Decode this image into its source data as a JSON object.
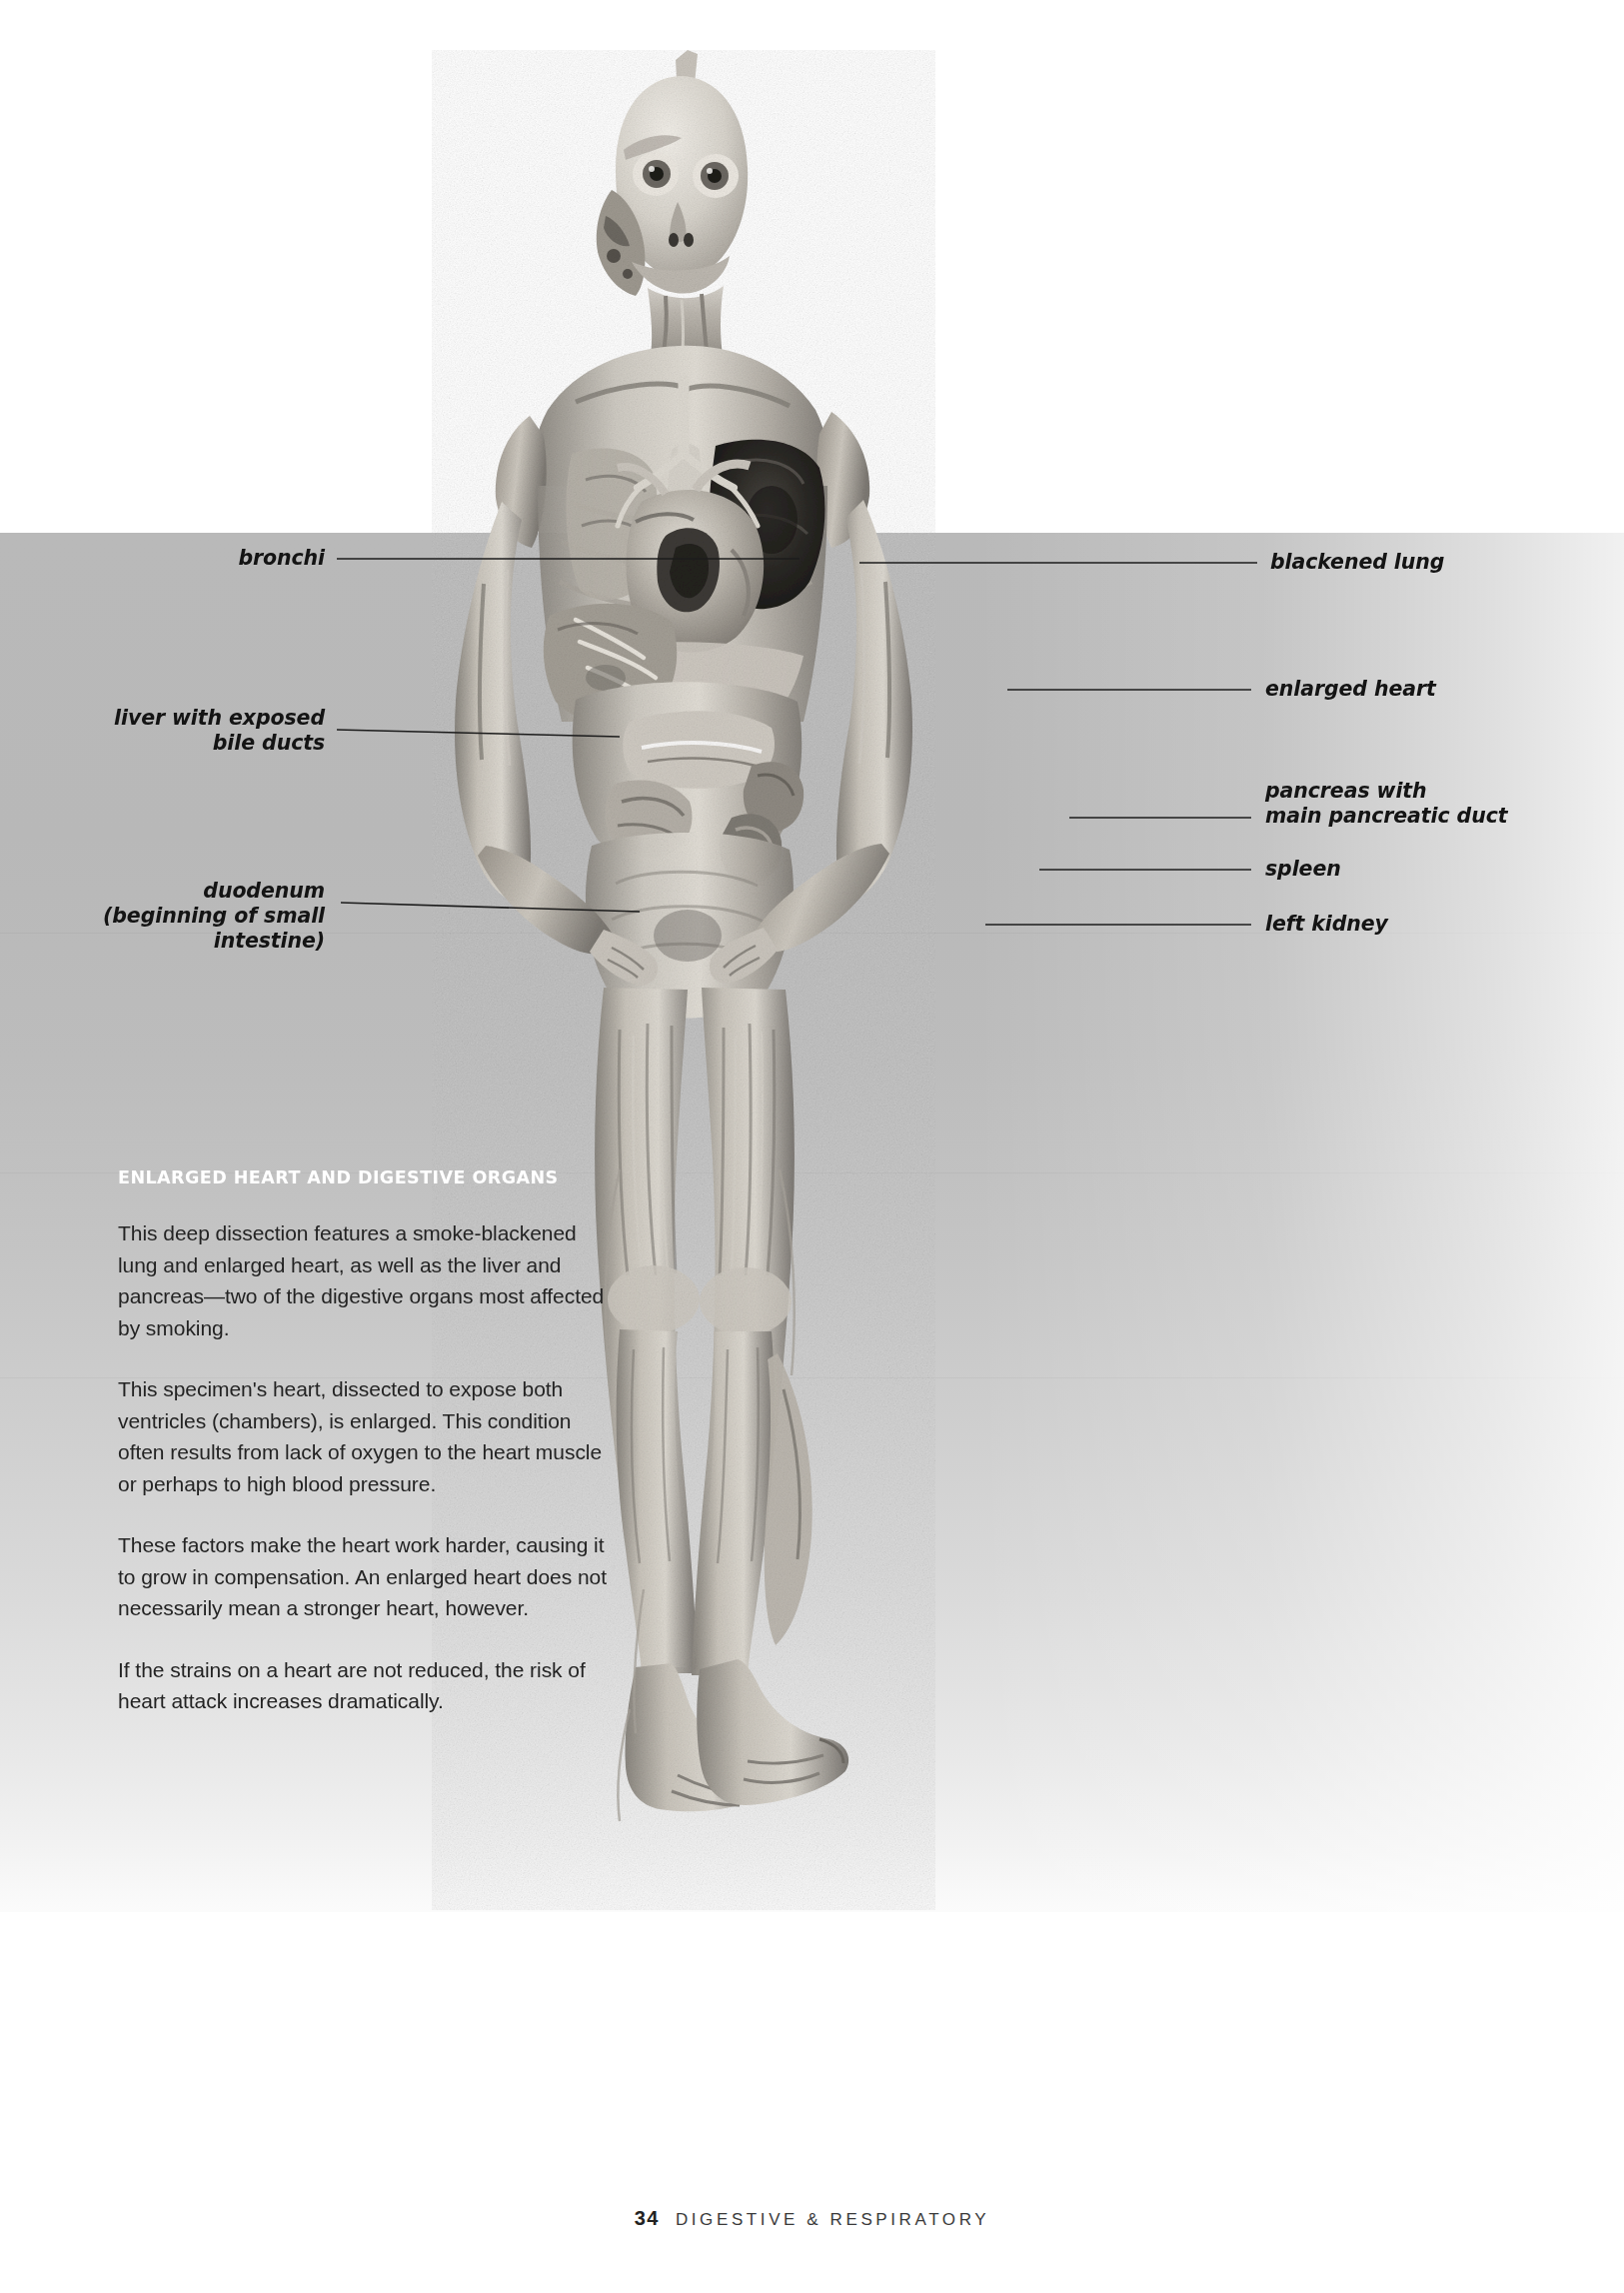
{
  "page": {
    "number": "34",
    "chapter_line": "DIGESTIVE & RESPIRATORY"
  },
  "callouts": {
    "left": [
      {
        "id": "bronchi",
        "label": "bronchi"
      },
      {
        "id": "liver",
        "label": "liver with exposed\nbile ducts"
      },
      {
        "id": "duodenum",
        "label": "duodenum\n(beginning of small\nintestine)"
      }
    ],
    "right": [
      {
        "id": "blackened-lung",
        "label": "blackened lung"
      },
      {
        "id": "enlarged-heart",
        "label": "enlarged heart"
      },
      {
        "id": "pancreas",
        "label": "pancreas with\nmain pancreatic duct"
      },
      {
        "id": "spleen",
        "label": "spleen"
      },
      {
        "id": "left-kidney",
        "label": "left kidney"
      }
    ]
  },
  "article": {
    "heading": "ENLARGED HEART AND DIGESTIVE ORGANS",
    "paragraphs": [
      "This deep dissection features a smoke-blackened lung and enlarged heart, as well as the liver and pancreas—two of the digestive organs most affected by smoking.",
      "This specimen's heart, dissected to expose both ventricles (chambers), is enlarged. This condition often results from lack of oxygen to the heart muscle or perhaps to high blood pressure.",
      "These factors make the heart work harder, causing it to grow in compensation. An enlarged heart does not necessarily mean a stronger heart, however.",
      "If the strains on a heart are not reduced, the risk of heart attack increases dramatically."
    ]
  },
  "figure": {
    "caption_subject": "whole-body plastinated dissection, anterior view",
    "accent_color": "#b9b9b9",
    "heading_color": "#ffffff",
    "text_color": "#232323"
  }
}
